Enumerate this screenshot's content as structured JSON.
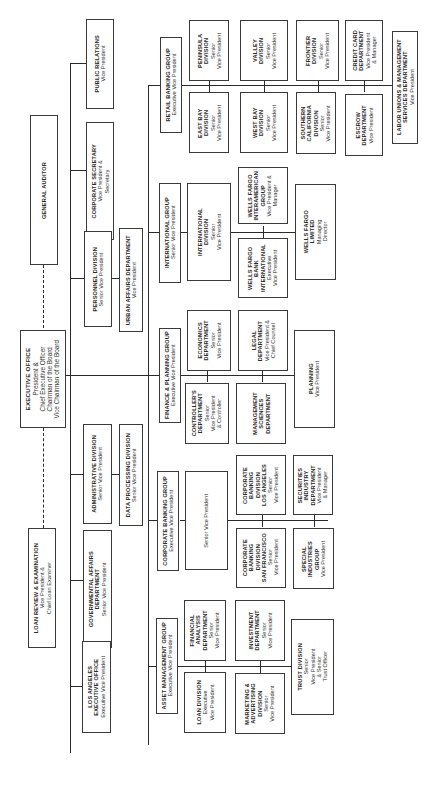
{
  "chart": {
    "orientation": "rotated-90-ccw",
    "root": {
      "name": "EXECUTIVE OFFICE",
      "lines": [
        "President &",
        "Chief Executive Officer",
        "Chairman of the Board",
        "Vice Chairman of the Board"
      ]
    },
    "staff_dashed": [
      {
        "name": "GENERAL AUDITOR",
        "lines": []
      },
      {
        "name": "LOAN REVIEW & EXAMINATION",
        "lines": [
          "Vice President &",
          "Chief Loan Examiner"
        ]
      }
    ],
    "staff": [
      {
        "name": "PUBLIC RELATIONS",
        "lines": [
          "Vice President"
        ]
      },
      {
        "name": "CORPORATE SECRETARY",
        "lines": [
          "Vice President &",
          "Secretary"
        ]
      },
      {
        "name": "PERSONNEL DIVISION",
        "lines": [
          "Senior Vice President"
        ]
      },
      {
        "name": "URBAN AFFAIRS DEPARTMENT",
        "lines": [
          "Vice President"
        ]
      },
      {
        "name": "ADMINISTRATIVE DIVISION",
        "lines": [
          "Senior Vice President"
        ]
      },
      {
        "name": "DATA PROCESSING DIVISION",
        "lines": [
          "Senior Vice President"
        ]
      },
      {
        "name": "GOVERNMENTAL AFFAIRS DEPARTMENT",
        "lines": [
          "Senior Vice President"
        ]
      },
      {
        "name": "LOS ANGELES EXECUTIVE OFFICE",
        "lines": [
          "Executive Vice President"
        ]
      }
    ],
    "groups": [
      {
        "name": "RETAIL BANKING GROUP",
        "lines": [
          "Executive Vice President"
        ],
        "units": [
          {
            "name": "PENINSULA DIVISION",
            "lines": [
              "Senior",
              "Vice President"
            ]
          },
          {
            "name": "EAST BAY DIVISION",
            "lines": [
              "Senior",
              "Vice President"
            ]
          },
          {
            "name": "VALLEY DIVISION",
            "lines": [
              "Senior",
              "Vice President"
            ]
          },
          {
            "name": "WEST BAY DIVISION",
            "lines": [
              "Senior",
              "Vice President"
            ]
          },
          {
            "name": "FRONTIER DIVISION",
            "lines": [
              "Senior",
              "Vice President"
            ]
          },
          {
            "name": "SOUTHERN CALIFORNIA DIVISION",
            "lines": [
              "Senior",
              "Vice President"
            ]
          },
          {
            "name": "CREDIT CARD DEPARTMENT",
            "lines": [
              "Vice President",
              "& Manager"
            ]
          },
          {
            "name": "ESCROW DEPARTMENT",
            "lines": [
              "Vice President"
            ]
          },
          {
            "name": "LABOR UNIONS & MANAGEMENT SERVICES DEPARTMENT",
            "lines": [
              "Vice President"
            ]
          }
        ]
      },
      {
        "name": "INTERNATIONAL GROUP",
        "lines": [
          "Senior Vice President"
        ],
        "units": [
          {
            "name": "INTERNATIONAL DIVISION",
            "lines": [
              "Senior",
              "Vice President"
            ]
          },
          {
            "name": "WELLS FARGO INTERAMERICAN GROUP",
            "lines": [
              "Vice President &",
              "Manager"
            ]
          },
          {
            "name": "WELLS FARGO BANK INTERNATIONAL",
            "lines": [
              "Executive",
              "Vice President"
            ]
          },
          {
            "name": "WELLS FARGO LIMITED",
            "lines": [
              "Managing",
              "Director"
            ]
          }
        ]
      },
      {
        "name": "FINANCE & PLANNING GROUP",
        "lines": [
          "Executive Vice President"
        ],
        "units": [
          {
            "name": "ECONOMICS DEPARTMENT",
            "lines": [
              "Senior",
              "Vice President"
            ]
          },
          {
            "name": "CONTROLLER'S DEPARTMENT",
            "lines": [
              "Senior",
              "Vice President",
              "& Controller"
            ]
          },
          {
            "name": "LEGAL DEPARTMENT",
            "lines": [
              "Vice President &",
              "Chief Counsel"
            ]
          },
          {
            "name": "MANAGEMENT SCIENCES DEPARTMENT",
            "lines": []
          },
          {
            "name": "PLANNING",
            "lines": [
              "Vice President"
            ]
          }
        ]
      },
      {
        "name": "CORPORATE BANKING GROUP",
        "lines": [
          "Executive Vice President"
        ],
        "units": [
          {
            "name": "",
            "lines": [
              "Senior Vice President"
            ]
          },
          {
            "name": "CORPORATE BANKING DIVISION LOS ANGELES",
            "lines": [
              "Senior",
              "Vice President"
            ]
          },
          {
            "name": "CORPORATE BANKING DIVISION SAN FRANCISCO",
            "lines": [
              "Senior",
              "Vice President"
            ]
          },
          {
            "name": "SECURITIES INDUSTRY DEPARTMENT",
            "lines": [
              "Vice President",
              "& Manager"
            ]
          },
          {
            "name": "SPECIAL INDUSTRIES GROUP",
            "lines": [
              "Vice President"
            ]
          }
        ]
      },
      {
        "name": "ASSET MANAGEMENT GROUP",
        "lines": [
          "Executive Vice President"
        ],
        "units": [
          {
            "name": "FINANCIAL ANALYSIS DEPARTMENT",
            "lines": [
              "Senior",
              "Vice President"
            ]
          },
          {
            "name": "LOAN DIVISION",
            "lines": [
              "Executive",
              "Vice President"
            ]
          },
          {
            "name": "INVESTMENT DEPARTMENT",
            "lines": [
              "Senior",
              "Vice President"
            ]
          },
          {
            "name": "MARKETING & ADVERTISING DIVISION",
            "lines": [
              "Senior",
              "Vice President"
            ]
          },
          {
            "name": "TRUST DIVISION",
            "lines": [
              "Senior",
              "Vice President",
              "& Senior",
              "Trust Officer"
            ]
          }
        ]
      }
    ]
  },
  "boxes": {
    "executive_office": {
      "title": "EXECUTIVE OFFICE",
      "l1": "President &",
      "l2": "Chief Executive Officer",
      "l3": "Chairman of the Board",
      "l4": "Vice Chairman of the Board"
    },
    "general_auditor": {
      "title": "GENERAL AUDITOR"
    },
    "loan_review": {
      "title": "LOAN REVIEW & EXAMINATION",
      "l1": "Vice President &",
      "l2": "Chief Loan Examiner"
    },
    "public_relations": {
      "title": "PUBLIC RELATIONS",
      "l1": "Vice President"
    },
    "corporate_secretary": {
      "title": "CORPORATE SECRETARY",
      "l1": "Vice President &",
      "l2": "Secretary"
    },
    "personnel": {
      "title": "PERSONNEL DIVISION",
      "l1": "Senior Vice President"
    },
    "urban_affairs": {
      "title": "URBAN AFFAIRS DEPARTMENT",
      "l1": "Vice President"
    },
    "administrative": {
      "title": "ADMINISTRATIVE DIVISION",
      "l1": "Senior Vice President"
    },
    "data_processing": {
      "title": "DATA PROCESSING DIVISION",
      "l1": "Senior Vice President"
    },
    "governmental_affairs": {
      "title1": "GOVERNMENTAL AFFAIRS",
      "title2": "DEPARTMENT",
      "l1": "Senior Vice President"
    },
    "la_exec": {
      "title1": "LOS ANGELES",
      "title2": "EXECUTIVE OFFICE",
      "l1": "Executive Vice President"
    },
    "retail_group": {
      "title": "RETAIL BANKING GROUP",
      "l1": "Executive Vice President"
    },
    "peninsula": {
      "t1": "PENINSULA",
      "t2": "DIVISION",
      "l1": "Senior",
      "l2": "Vice President"
    },
    "east_bay": {
      "t1": "EAST BAY",
      "t2": "DIVISION",
      "l1": "Senior",
      "l2": "Vice President"
    },
    "valley": {
      "t1": "VALLEY",
      "t2": "DIVISION",
      "l1": "Senior",
      "l2": "Vice President"
    },
    "west_bay": {
      "t1": "WEST BAY",
      "t2": "DIVISION",
      "l1": "Senior",
      "l2": "Vice President"
    },
    "frontier": {
      "t1": "FRONTIER",
      "t2": "DIVISION",
      "l1": "Senior",
      "l2": "Vice President"
    },
    "socal": {
      "t1": "SOUTHERN",
      "t2": "CALIFORNIA",
      "t3": "DIVISION",
      "l1": "Senior",
      "l2": "Vice President"
    },
    "credit_card": {
      "t1": "CREDIT CARD",
      "t2": "DEPARTMENT",
      "l1": "Vice President",
      "l2": "& Manager"
    },
    "escrow": {
      "t1": "ESCROW",
      "t2": "DEPARTMENT",
      "l1": "Vice President"
    },
    "labor_unions": {
      "t1": "LABOR UNIONS & MANAGEMENT",
      "t2": "SERVICES DEPARTMENT",
      "l1": "Vice President"
    },
    "intl_group": {
      "title": "INTERNATIONAL GROUP",
      "l1": "Senior Vice President"
    },
    "intl_division": {
      "t1": "INTERNATIONAL",
      "t2": "DIVISION",
      "l1": "Senior",
      "l2": "Vice President"
    },
    "wf_interamerican": {
      "t1": "WELLS FARGO",
      "t2": "INTERAMERICAN",
      "t3": "GROUP",
      "l1": "Vice President &",
      "l2": "Manager"
    },
    "wf_bank_intl": {
      "t1": "WELLS FARGO",
      "t2": "BANK",
      "t3": "INTERNATIONAL",
      "l1": "Executive",
      "l2": "Vice President"
    },
    "wf_limited": {
      "t1": "WELLS FARGO",
      "t2": "LIMITED",
      "l1": "Managing",
      "l2": "Director"
    },
    "finance_group": {
      "title": "FINANCE & PLANNING GROUP",
      "l1": "Executive Vice President"
    },
    "economics": {
      "t1": "ECONOMICS",
      "t2": "DEPARTMENT",
      "l1": "Senior",
      "l2": "Vice President"
    },
    "controllers": {
      "t1": "CONTROLLER'S",
      "t2": "DEPARTMENT",
      "l1": "Senior",
      "l2": "Vice President",
      "l3": "& Controller"
    },
    "legal": {
      "t1": "LEGAL",
      "t2": "DEPARTMENT",
      "l1": "Vice President &",
      "l2": "Chief Counsel"
    },
    "mgmt_sciences": {
      "t1": "MANAGEMENT",
      "t2": "SCIENCES",
      "t3": "DEPARTMENT"
    },
    "planning": {
      "t1": "PLANNING",
      "l1": "Vice President"
    },
    "corp_group": {
      "title": "CORPORATE BANKING GROUP",
      "l1": "Executive Vice President"
    },
    "corp_svp": {
      "l1": "Senior Vice President"
    },
    "corp_la": {
      "t1": "CORPORATE",
      "t2": "BANKING",
      "t3": "DIVISION",
      "t4": "LOS ANGELES",
      "l1": "Senior",
      "l2": "Vice President"
    },
    "corp_sf": {
      "t1": "CORPORATE",
      "t2": "BANKING",
      "t3": "DIVISION",
      "t4": "SAN FRANCISCO",
      "l1": "Senior",
      "l2": "Vice President"
    },
    "securities": {
      "t1": "SECURITIES",
      "t2": "INDUSTRY",
      "t3": "DEPARTMENT",
      "l1": "Vice President",
      "l2": "& Manager"
    },
    "special_ind": {
      "t1": "SPECIAL",
      "t2": "INDUSTRIES",
      "t3": "GROUP",
      "l1": "Vice President"
    },
    "asset_group": {
      "title": "ASSET MANAGEMENT GROUP",
      "l1": "Executive Vice President"
    },
    "fin_analysis": {
      "t1": "FINANCIAL",
      "t2": "ANALYSIS",
      "t3": "DEPARTMENT",
      "l1": "Senior",
      "l2": "Vice President"
    },
    "loan_div": {
      "t1": "LOAN DIVISION",
      "l1": "Executive",
      "l2": "Vice President"
    },
    "investment": {
      "t1": "INVESTMENT",
      "t2": "DEPARTMENT",
      "l1": "Senior",
      "l2": "Vice President"
    },
    "marketing": {
      "t1": "MARKETING &",
      "t2": "ADVERTISING",
      "t3": "DIVISION",
      "l1": "Senior",
      "l2": "Vice President"
    },
    "trust": {
      "t1": "TRUST DIVISION",
      "l1": "Senior",
      "l2": "Vice President",
      "l3": "& Senior",
      "l4": "Trust Officer"
    }
  }
}
